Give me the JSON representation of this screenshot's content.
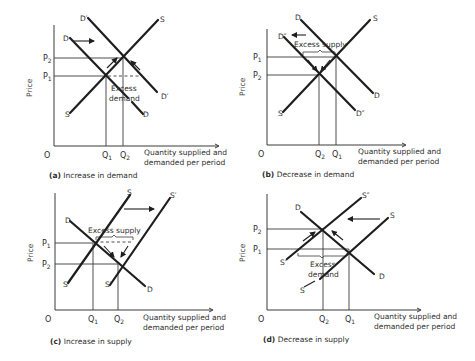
{
  "figure": {
    "panels": [
      {
        "id": "a",
        "caption_letter": "(a)",
        "caption_text": "Increase in demand",
        "y_axis_label": "Price",
        "x_axis_label_line1": "Quantity supplied and",
        "x_axis_label_line2": "demanded per period",
        "origin_label": "O",
        "price_labels": [
          "P",
          "2",
          "P",
          "1"
        ],
        "quantity_labels": [
          "Q",
          "1",
          "Q",
          "2"
        ],
        "curve_labels": {
          "s_top": "S",
          "s_bottom": "S",
          "d_top": "D",
          "d_bottom": "D",
          "d2_top": "D′",
          "d2_bottom": "D′"
        },
        "annotation_line1": "Excess",
        "annotation_line2": "demand"
      },
      {
        "id": "b",
        "caption_letter": "(b)",
        "caption_text": "Decrease in demand",
        "y_axis_label": "Price",
        "x_axis_label_line1": "Quantity supplied and",
        "x_axis_label_line2": "demanded per period",
        "origin_label": "O",
        "price_labels": [
          "P",
          "1",
          "P",
          "2"
        ],
        "quantity_labels": [
          "Q",
          "2",
          "Q",
          "1"
        ],
        "curve_labels": {
          "s_top": "S",
          "s_bottom": "S",
          "d_top": "D",
          "d_bottom": "D",
          "d2_top": "D″",
          "d2_bottom": "D″"
        },
        "annotation_line1": "Excess supply"
      },
      {
        "id": "c",
        "caption_letter": "(c)",
        "caption_text": "Increase in supply",
        "y_axis_label": "Price",
        "x_axis_label_line1": "Quantity supplied and",
        "x_axis_label_line2": "demanded per period",
        "origin_label": "O",
        "price_labels": [
          "P",
          "1",
          "P",
          "2"
        ],
        "quantity_labels": [
          "Q",
          "1",
          "Q",
          "2"
        ],
        "curve_labels": {
          "s_top": "S",
          "s_bottom": "S",
          "s2_top": "S′",
          "s2_bottom": "S′",
          "d_top": "D",
          "d_bottom": "D"
        },
        "annotation_line1": "Excess supply"
      },
      {
        "id": "d",
        "caption_letter": "(d)",
        "caption_text": "Decrease in supply",
        "y_axis_label": "Price",
        "x_axis_label_line1": "Quantity supplied and",
        "x_axis_label_line2": "demanded per period",
        "origin_label": "O",
        "price_labels": [
          "P",
          "2",
          "P",
          "1"
        ],
        "quantity_labels": [
          "Q",
          "2",
          "Q",
          "1"
        ],
        "curve_labels": {
          "s_top": "S",
          "s_bottom": "S",
          "s2_top": "S″",
          "s2_bottom": "S″",
          "d_top": "D",
          "d_bottom": "D"
        },
        "annotation_line1": "Excess",
        "annotation_line2": "demand"
      }
    ]
  }
}
